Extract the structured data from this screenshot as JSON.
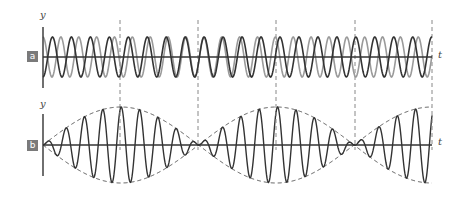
{
  "figure": {
    "width": 462,
    "height": 197,
    "colors": {
      "axis": "#333333",
      "wave_dark": "#333333",
      "wave_light": "#9a9a9a",
      "envelope": "#555555",
      "dashed_guides": "#888888",
      "badge_bg": "#7a7a7a",
      "badge_text": "#ffffff"
    },
    "guides_x": [
      120,
      198,
      276,
      355,
      432
    ],
    "axis_left_x": 43,
    "axis_right_x": 432,
    "beat": {
      "node_x": [
        43,
        198,
        355
      ],
      "antinode_x": [
        120,
        276,
        432
      ],
      "half_period_px": 155.5,
      "carrier_period_px": 18.4
    }
  },
  "panels": [
    {
      "id": "a",
      "badge": "a",
      "y_label": "y",
      "t_label": "t",
      "center_y": 57,
      "axis_top": 27,
      "axis_bottom": 88,
      "amplitude": 20,
      "description": "Two individual waves of slightly different frequency superposed",
      "series": [
        {
          "name": "wave 1",
          "color": "#333333"
        },
        {
          "name": "wave 2",
          "color": "#9a9a9a"
        }
      ]
    },
    {
      "id": "b",
      "badge": "b",
      "y_label": "y",
      "t_label": "t",
      "center_y": 145,
      "axis_top": 114,
      "axis_bottom": 176,
      "amplitude": 38,
      "description": "Resultant wave showing beats with dashed envelope",
      "series": [
        {
          "name": "resultant",
          "color": "#333333"
        },
        {
          "name": "envelope",
          "color": "#555555",
          "style": "dashed"
        }
      ]
    }
  ]
}
